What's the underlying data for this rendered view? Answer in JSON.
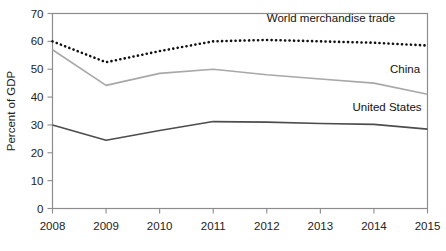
{
  "chart_data": {
    "type": "line",
    "title": "",
    "xlabel": "",
    "ylabel": "Percent of GDP",
    "x": [
      2008,
      2009,
      2010,
      2011,
      2012,
      2013,
      2014,
      2015
    ],
    "categories": [
      "2008",
      "2009",
      "2010",
      "2011",
      "2012",
      "2013",
      "2014",
      "2015"
    ],
    "xlim": [
      2008,
      2015
    ],
    "ylim": [
      0,
      70
    ],
    "yticks": [
      0,
      10,
      20,
      30,
      40,
      50,
      60,
      70
    ],
    "ytick_labels": [
      "0",
      "10",
      "20",
      "30",
      "40",
      "50",
      "60",
      "70"
    ],
    "xticks": [
      2008,
      2009,
      2010,
      2011,
      2012,
      2013,
      2014,
      2015
    ],
    "xtick_labels": [
      "2008",
      "2009",
      "2010",
      "2011",
      "2012",
      "2013",
      "2014",
      "2015"
    ],
    "grid": false,
    "legend_position": "inline-right",
    "series": [
      {
        "name": "World merchandise trade",
        "label": "World merchandise trade",
        "style": "dotted",
        "color": "#111111",
        "values": [
          60.0,
          52.5,
          56.5,
          60.0,
          60.5,
          60.0,
          59.5,
          58.5
        ]
      },
      {
        "name": "China",
        "label": "China",
        "style": "solid",
        "color": "#a8a8a8",
        "values": [
          57.0,
          44.2,
          48.5,
          50.0,
          48.0,
          46.5,
          45.0,
          41.0
        ]
      },
      {
        "name": "United States",
        "label": "United States",
        "style": "solid",
        "color": "#4d4d4d",
        "values": [
          30.0,
          24.5,
          28.0,
          31.2,
          31.0,
          30.5,
          30.2,
          28.5
        ]
      }
    ],
    "annotations": [
      {
        "text": "World merchandise trade",
        "series": "World merchandise trade",
        "x": 2012.0,
        "y": 67.0
      },
      {
        "text": "China",
        "series": "China",
        "x": 2014.3,
        "y": 48.5
      },
      {
        "text": "United States",
        "series": "United States",
        "x": 2013.6,
        "y": 35.0
      }
    ]
  }
}
